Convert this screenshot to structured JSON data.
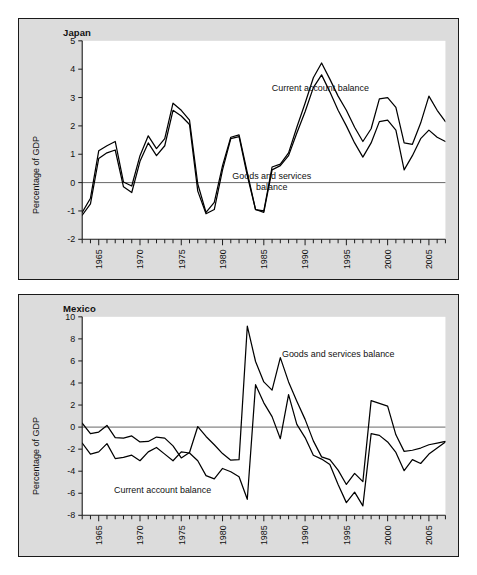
{
  "figure": {
    "background": "#ffffff",
    "panel_background": "#dcdcdc",
    "plot_background": "#ffffff",
    "line_color": "#000000"
  },
  "panels": [
    {
      "id": "japan",
      "title": "Japan",
      "ylabel": "Percentage of GDP",
      "label_current": "Current account balance",
      "label_goods_1": "Goods and services",
      "label_goods_2": "balance"
    },
    {
      "id": "mexico",
      "title": "Mexico",
      "ylabel": "Percentage of GDP",
      "label_current": "Current account balance",
      "label_goods": "Goods and services balance"
    }
  ],
  "chart_data": [
    {
      "type": "line",
      "title": "Japan",
      "xlabel": "",
      "ylabel": "Percentage of GDP",
      "xlim": [
        1963,
        2007
      ],
      "ylim": [
        -2,
        5
      ],
      "yticks": [
        -2,
        -1,
        0,
        1,
        2,
        3,
        4,
        5
      ],
      "xticks": [
        1965,
        1970,
        1975,
        1980,
        1985,
        1990,
        1995,
        2000,
        2005
      ],
      "xtick_labels": [
        "1965",
        "1970",
        "1975",
        "1980",
        "1985",
        "1990",
        "1995",
        "2000",
        "2005"
      ],
      "ytick_labels": [
        "-2",
        "-1",
        "0",
        "1",
        "2",
        "3",
        "4",
        "5"
      ],
      "minor_xticks_every": 1,
      "grid": false,
      "legend": "inline-annotations",
      "x": [
        1963,
        1964,
        1965,
        1966,
        1967,
        1968,
        1969,
        1970,
        1971,
        1972,
        1973,
        1974,
        1975,
        1976,
        1977,
        1978,
        1979,
        1980,
        1981,
        1982,
        1983,
        1984,
        1985,
        1986,
        1987,
        1988,
        1989,
        1990,
        1991,
        1992,
        1993,
        1994,
        1995,
        1996,
        1997,
        1998,
        1999,
        2000,
        2001,
        2002,
        2003,
        2004,
        2005,
        2006,
        2007
      ],
      "series": [
        {
          "name": "Current account balance",
          "values": [
            -1.05,
            -0.55,
            1.12,
            1.3,
            1.45,
            0.02,
            -0.12,
            0.95,
            1.65,
            1.2,
            1.55,
            2.8,
            2.55,
            2.2,
            -0.05,
            -1.05,
            -0.7,
            0.6,
            1.6,
            1.68,
            0.35,
            -0.95,
            -1.0,
            0.55,
            0.65,
            1.05,
            1.95,
            2.8,
            3.7,
            4.22,
            3.65,
            3.05,
            2.55,
            1.95,
            1.45,
            1.9,
            2.95,
            3.0,
            2.65,
            1.4,
            1.35,
            2.1,
            3.05,
            2.55,
            2.15,
            2.55,
            2.45,
            2.1,
            2.85,
            3.25,
            3.7,
            3.55,
            3.9,
            4.8
          ]
        },
        {
          "name": "Goods and services balance",
          "values": [
            -1.15,
            -0.75,
            0.85,
            1.05,
            1.15,
            -0.15,
            -0.35,
            0.75,
            1.4,
            0.95,
            1.3,
            2.55,
            2.35,
            2.05,
            -0.3,
            -1.1,
            -0.95,
            0.45,
            1.55,
            1.62,
            0.25,
            -0.95,
            -1.05,
            0.45,
            0.6,
            0.95,
            1.75,
            2.5,
            3.35,
            3.8,
            3.2,
            2.55,
            2.0,
            1.4,
            0.9,
            1.4,
            2.15,
            2.2,
            1.85,
            0.45,
            0.95,
            1.55,
            1.85,
            1.6,
            1.45,
            1.7,
            1.5,
            0.65,
            1.15,
            1.65,
            2.0,
            1.5,
            1.4,
            1.85
          ]
        }
      ]
    },
    {
      "type": "line",
      "title": "Mexico",
      "xlabel": "",
      "ylabel": "Percentage of GDP",
      "xlim": [
        1963,
        2007
      ],
      "ylim": [
        -8,
        10
      ],
      "yticks": [
        -8,
        -6,
        -4,
        -2,
        0,
        2,
        4,
        6,
        8,
        10
      ],
      "xticks": [
        1965,
        1970,
        1975,
        1980,
        1985,
        1990,
        1995,
        2000,
        2005
      ],
      "xtick_labels": [
        "1965",
        "1970",
        "1975",
        "1980",
        "1985",
        "1990",
        "1995",
        "2000",
        "2005"
      ],
      "ytick_labels": [
        "-8",
        "-6",
        "-4",
        "-2",
        "0",
        "2",
        "4",
        "6",
        "8",
        "10"
      ],
      "minor_xticks_every": 1,
      "grid": false,
      "legend": "inline-annotations",
      "x": [
        1963,
        1964,
        1965,
        1966,
        1967,
        1968,
        1969,
        1970,
        1971,
        1972,
        1973,
        1974,
        1975,
        1976,
        1977,
        1978,
        1979,
        1980,
        1981,
        1982,
        1983,
        1984,
        1985,
        1986,
        1987,
        1988,
        1989,
        1990,
        1991,
        1992,
        1993,
        1994,
        1995,
        1996,
        1997,
        1998,
        1999,
        2000,
        2001,
        2002,
        2003,
        2004,
        2005,
        2006,
        2007
      ],
      "series": [
        {
          "name": "Goods and services balance",
          "values": [
            0.35,
            -0.6,
            -0.45,
            0.15,
            -0.95,
            -1.0,
            -0.8,
            -1.35,
            -1.3,
            -0.9,
            -1.0,
            -1.7,
            -2.8,
            -2.3,
            0.05,
            -0.85,
            -1.6,
            -2.4,
            -3.0,
            -2.95,
            9.15,
            5.95,
            4.1,
            3.35,
            6.3,
            4.1,
            2.35,
            0.7,
            -1.25,
            -2.7,
            -2.95,
            -3.9,
            -5.2,
            -4.2,
            -4.95,
            2.4,
            2.15,
            1.9,
            -0.7,
            -2.2,
            -2.1,
            -1.9,
            -1.6,
            -1.45,
            -1.3,
            -1.7,
            -2.2,
            -2.1,
            -1.85
          ]
        },
        {
          "name": "Current account balance",
          "values": [
            -1.45,
            -2.45,
            -2.25,
            -1.5,
            -2.85,
            -2.75,
            -2.55,
            -3.05,
            -2.25,
            -1.85,
            -2.45,
            -3.05,
            -2.25,
            -2.35,
            -3.05,
            -4.4,
            -4.7,
            -3.75,
            -4.05,
            -4.5,
            -6.55,
            3.85,
            2.2,
            0.95,
            -1.05,
            2.95,
            0.25,
            -0.95,
            -2.55,
            -2.9,
            -3.4,
            -5.2,
            -6.85,
            -5.9,
            -7.15,
            -0.6,
            -0.75,
            -1.35,
            -2.3,
            -3.95,
            -2.95,
            -3.3,
            -2.45,
            -1.9,
            -1.35,
            -2.2,
            -1.8,
            -0.25,
            -0.7
          ]
        }
      ]
    }
  ]
}
